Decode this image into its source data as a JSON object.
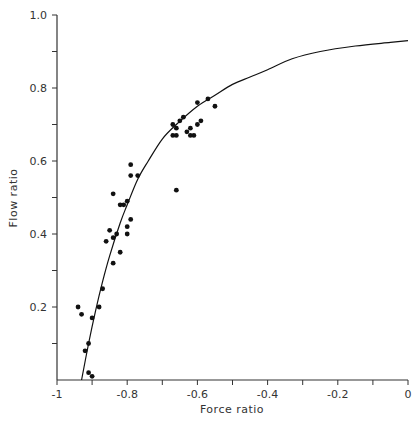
{
  "chart_data": {
    "type": "scatter",
    "title": "",
    "xlabel": "Force ratio",
    "ylabel": "Flow ratio",
    "xlim": [
      -1,
      0
    ],
    "ylim": [
      0,
      1.0
    ],
    "grid": false,
    "legend": null,
    "x_ticks": [
      -1,
      -0.9,
      -0.8,
      -0.7,
      -0.6,
      -0.5,
      -0.4,
      -0.3,
      -0.2,
      -0.1,
      0
    ],
    "x_tick_labels": [
      "-1",
      "",
      "-0.8",
      "",
      "-0.6",
      "",
      "-0.4",
      "",
      "-0.2",
      "",
      "0"
    ],
    "y_ticks": [
      0.1,
      0.2,
      0.3,
      0.4,
      0.5,
      0.6,
      0.7,
      0.8,
      0.9,
      1.0
    ],
    "y_tick_labels": [
      "",
      "0.2",
      "",
      "0.4",
      "",
      "0.6",
      "",
      "0.8",
      "",
      "1.0"
    ],
    "series": [
      {
        "name": "observed",
        "kind": "scatter",
        "points": [
          [
            -0.94,
            0.2
          ],
          [
            -0.93,
            0.18
          ],
          [
            -0.88,
            0.2
          ],
          [
            -0.9,
            0.17
          ],
          [
            -0.91,
            0.1
          ],
          [
            -0.92,
            0.08
          ],
          [
            -0.91,
            0.02
          ],
          [
            -0.9,
            0.01
          ],
          [
            -0.87,
            0.25
          ],
          [
            -0.84,
            0.32
          ],
          [
            -0.86,
            0.38
          ],
          [
            -0.84,
            0.39
          ],
          [
            -0.82,
            0.35
          ],
          [
            -0.83,
            0.4
          ],
          [
            -0.8,
            0.42
          ],
          [
            -0.8,
            0.4
          ],
          [
            -0.81,
            0.48
          ],
          [
            -0.79,
            0.44
          ],
          [
            -0.85,
            0.41
          ],
          [
            -0.82,
            0.48
          ],
          [
            -0.8,
            0.49
          ],
          [
            -0.84,
            0.51
          ],
          [
            -0.79,
            0.56
          ],
          [
            -0.79,
            0.59
          ],
          [
            -0.77,
            0.56
          ],
          [
            -0.66,
            0.52
          ],
          [
            -0.67,
            0.7
          ],
          [
            -0.66,
            0.69
          ],
          [
            -0.65,
            0.71
          ],
          [
            -0.64,
            0.72
          ],
          [
            -0.67,
            0.67
          ],
          [
            -0.66,
            0.67
          ],
          [
            -0.63,
            0.68
          ],
          [
            -0.62,
            0.69
          ],
          [
            -0.62,
            0.67
          ],
          [
            -0.61,
            0.67
          ],
          [
            -0.6,
            0.7
          ],
          [
            -0.59,
            0.71
          ],
          [
            -0.6,
            0.76
          ],
          [
            -0.57,
            0.77
          ],
          [
            -0.55,
            0.75
          ]
        ]
      },
      {
        "name": "fitted curve",
        "kind": "line",
        "points": [
          [
            -0.93,
            0.0
          ],
          [
            -0.91,
            0.1
          ],
          [
            -0.89,
            0.19
          ],
          [
            -0.87,
            0.27
          ],
          [
            -0.85,
            0.34
          ],
          [
            -0.82,
            0.43
          ],
          [
            -0.8,
            0.48
          ],
          [
            -0.77,
            0.55
          ],
          [
            -0.74,
            0.6
          ],
          [
            -0.7,
            0.66
          ],
          [
            -0.66,
            0.7
          ],
          [
            -0.6,
            0.75
          ],
          [
            -0.55,
            0.78
          ],
          [
            -0.5,
            0.81
          ],
          [
            -0.45,
            0.83
          ],
          [
            -0.4,
            0.85
          ],
          [
            -0.33,
            0.88
          ],
          [
            -0.25,
            0.9
          ],
          [
            -0.15,
            0.915
          ],
          [
            -0.05,
            0.925
          ],
          [
            0.0,
            0.93
          ]
        ]
      }
    ]
  },
  "colors": {
    "ink": "#111111",
    "axis": "#333333",
    "background": "#ffffff"
  }
}
